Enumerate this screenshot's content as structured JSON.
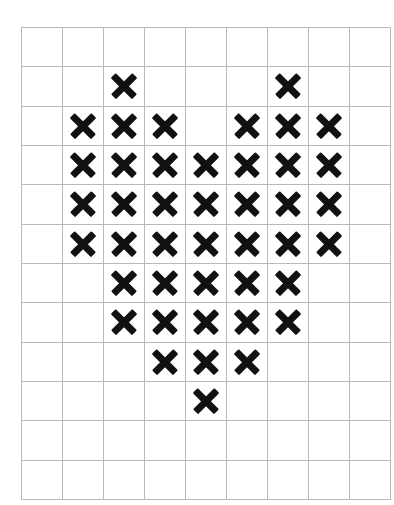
{
  "chart": {
    "title": "HEART CROSS STITCH CHART",
    "symbol": "X",
    "symbol_color": "#111111",
    "grid_line_color": "#b9b9b9",
    "background_color": "#ffffff",
    "columns": 9,
    "rows": 12
  },
  "chart_data": {
    "type": "heatmap",
    "title": "HEART CROSS STITCH CHART",
    "xlabel": "",
    "ylabel": "",
    "grid": true,
    "legend": "none",
    "columns": 9,
    "rows": 12,
    "cell_values": {
      "filled": "X",
      "empty": ""
    },
    "x": [
      0,
      1,
      2,
      3,
      4,
      5,
      6,
      7,
      8
    ],
    "y": [
      0,
      1,
      2,
      3,
      4,
      5,
      6,
      7,
      8,
      9,
      10,
      11
    ],
    "matrix": [
      [
        0,
        0,
        0,
        0,
        0,
        0,
        0,
        0,
        0
      ],
      [
        0,
        0,
        1,
        0,
        0,
        0,
        1,
        0,
        0
      ],
      [
        0,
        1,
        1,
        1,
        0,
        1,
        1,
        1,
        0
      ],
      [
        0,
        1,
        1,
        1,
        1,
        1,
        1,
        1,
        0
      ],
      [
        0,
        1,
        1,
        1,
        1,
        1,
        1,
        1,
        0
      ],
      [
        0,
        1,
        1,
        1,
        1,
        1,
        1,
        1,
        0
      ],
      [
        0,
        0,
        1,
        1,
        1,
        1,
        1,
        0,
        0
      ],
      [
        0,
        0,
        1,
        1,
        1,
        1,
        1,
        0,
        0
      ],
      [
        0,
        0,
        0,
        1,
        1,
        1,
        0,
        0,
        0
      ],
      [
        0,
        0,
        0,
        0,
        1,
        0,
        0,
        0,
        0
      ],
      [
        0,
        0,
        0,
        0,
        0,
        0,
        0,
        0,
        0
      ],
      [
        0,
        0,
        0,
        0,
        0,
        0,
        0,
        0,
        0
      ]
    ],
    "stitch_count": 45,
    "filled_cells_by_row": [
      [],
      [
        2,
        6
      ],
      [
        1,
        2,
        3,
        5,
        6,
        7
      ],
      [
        1,
        2,
        3,
        4,
        5,
        6,
        7
      ],
      [
        1,
        2,
        3,
        4,
        5,
        6,
        7
      ],
      [
        1,
        2,
        3,
        4,
        5,
        6,
        7
      ],
      [
        2,
        3,
        4,
        5,
        6
      ],
      [
        2,
        3,
        4,
        5,
        6
      ],
      [
        3,
        4,
        5
      ],
      [
        4
      ],
      [],
      []
    ]
  }
}
